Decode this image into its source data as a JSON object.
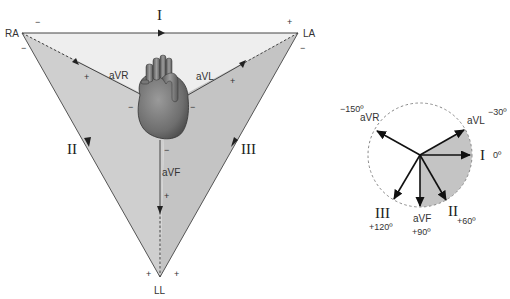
{
  "triangle": {
    "vertices": {
      "ra": {
        "label": "RA"
      },
      "la": {
        "label": "LA"
      },
      "ll": {
        "label": "LL"
      }
    },
    "limb_leads": [
      {
        "id": "I",
        "label": "I"
      },
      {
        "id": "II",
        "label": "II"
      },
      {
        "id": "III",
        "label": "III"
      }
    ],
    "augmented_leads": [
      {
        "id": "aVR",
        "label": "aVR"
      },
      {
        "id": "aVL",
        "label": "aVL"
      },
      {
        "id": "aVF",
        "label": "aVF"
      }
    ],
    "signs": {
      "plus": "+",
      "minus": "−"
    },
    "colors": {
      "triangle_fill_light": "#eeeeee",
      "triangle_fill_dark": "#c8c8c8",
      "edge": "#555555",
      "heart": "#7a7a7a"
    }
  },
  "hexaxial": {
    "axes": [
      {
        "lead": "I",
        "label": "I",
        "angle": "0º"
      },
      {
        "lead": "aVL",
        "label": "aVL",
        "angle": "−30º"
      },
      {
        "lead": "II",
        "label": "II",
        "angle": "+60º"
      },
      {
        "lead": "aVF",
        "label": "aVF",
        "angle": "+90º"
      },
      {
        "lead": "III",
        "label": "III",
        "angle": "+120º"
      },
      {
        "lead": "aVR",
        "label": "aVR",
        "angle": "−150º"
      }
    ],
    "colors": {
      "normal_sector": "#c8c8c8",
      "circle": "#888888"
    }
  }
}
